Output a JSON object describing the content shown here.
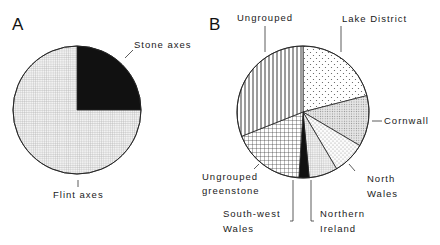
{
  "chart_data": [
    {
      "type": "pie",
      "panel": "A",
      "title": "A",
      "start_angle_deg": 0,
      "direction": "clockwise",
      "slices": [
        {
          "label": "Stone axes",
          "value": 25,
          "pattern": "solid-black"
        },
        {
          "label": "Flint axes",
          "value": 75,
          "pattern": "fine-grid"
        }
      ]
    },
    {
      "type": "pie",
      "panel": "B",
      "title": "B",
      "start_angle_deg": 0,
      "direction": "clockwise",
      "slices": [
        {
          "label": "Lake District",
          "value": 21,
          "pattern": "sparse-dots"
        },
        {
          "label": "Cornwall",
          "value": 12.5,
          "pattern": "dense-dots"
        },
        {
          "label": "North Wales",
          "value": 8,
          "pattern": "light-dots"
        },
        {
          "label": "Northern Ireland",
          "value": 7,
          "pattern": "fine-grid"
        },
        {
          "label": "South-west Wales",
          "value": 2.5,
          "pattern": "solid-black"
        },
        {
          "label": "Ungrouped greenstone",
          "value": 18,
          "pattern": "cross-hatch"
        },
        {
          "label": "Ungrouped",
          "value": 31,
          "pattern": "vertical-lines"
        }
      ]
    }
  ],
  "labels": {
    "panel_a": "A",
    "panel_b": "B",
    "stone_axes": "Stone axes",
    "flint_axes": "Flint axes",
    "ungrouped": "Ungrouped",
    "lake_district": "Lake District",
    "cornwall": "Cornwall",
    "north": "North",
    "wales": "Wales",
    "ungrouped_2": "Ungrouped",
    "greenstone": "greenstone",
    "south_west": "South-west",
    "wales_2": "Wales",
    "northern": "Northern",
    "ireland": "Ireland"
  }
}
